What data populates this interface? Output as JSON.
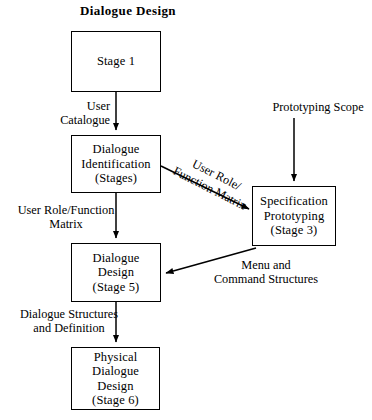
{
  "diagram": {
    "title": "Dialogue Design",
    "type": "flowchart",
    "nodes": [
      {
        "id": "stage1",
        "name": "stage-1",
        "lines": [
          "Stage 1"
        ],
        "x": 71,
        "y": 31,
        "w": 90,
        "h": 61
      },
      {
        "id": "dialogue_identification",
        "name": "dialogue-identification",
        "lines": [
          "Dialogue",
          "Identification",
          "(Stages)"
        ],
        "x": 71,
        "y": 135,
        "w": 90,
        "h": 58
      },
      {
        "id": "specification_prototyping",
        "name": "specification-prototyping",
        "lines": [
          "Specification",
          "Prototyping",
          "(Stage 3)"
        ],
        "x": 252,
        "y": 186,
        "w": 84,
        "h": 60
      },
      {
        "id": "dialogue_design",
        "name": "dialogue-design-stage-5",
        "lines": [
          "Dialogue",
          "Design",
          "(Stage 5)"
        ],
        "x": 71,
        "y": 243,
        "w": 90,
        "h": 59
      },
      {
        "id": "physical_dialogue_design",
        "name": "physical-dialogue-design",
        "lines": [
          "Physical",
          "Dialogue",
          "Design",
          "(Stage 6)"
        ],
        "x": 71,
        "y": 347,
        "w": 89,
        "h": 63
      }
    ],
    "edge_labels": [
      {
        "id": "user_catalogue",
        "name": "edge-label-user-catalogue",
        "lines": [
          "User",
          "Catalogue"
        ],
        "x": 30,
        "y": 99,
        "w": 80,
        "align": "right"
      },
      {
        "id": "user_role_function_matrix_left",
        "name": "edge-label-user-role-function-matrix",
        "lines": [
          "User Role/Function",
          "Matrix"
        ],
        "x": 3,
        "y": 203,
        "w": 126,
        "align": "center"
      },
      {
        "id": "dialogue_structures_and_definition",
        "name": "edge-label-dialogue-structures-and-definition",
        "lines": [
          "Dialogue Structures",
          "and Definition"
        ],
        "x": 3,
        "y": 307,
        "w": 132,
        "align": "center"
      },
      {
        "id": "prototyping_scope",
        "name": "edge-label-prototyping-scope",
        "lines": [
          "Prototyping Scope"
        ],
        "x": 265,
        "y": 100,
        "w": 106,
        "align": "center"
      },
      {
        "id": "menu_and_command_structures",
        "name": "edge-label-menu-and-command-structures",
        "lines": [
          "Menu and",
          "Command Structures"
        ],
        "x": 199,
        "y": 258,
        "w": 134,
        "align": "center"
      }
    ],
    "diagonal_labels": [
      {
        "id": "user_role_function_matrix_diagonal",
        "name": "edge-label-user-role-function-matrix-diagonal",
        "lines": [
          "User Role/",
          "Function Matrix"
        ],
        "cx": 213,
        "cy": 185,
        "rotate": 27
      }
    ],
    "connectors": [
      {
        "id": "stage1-to-identification",
        "name": "connector-stage1-to-dialogue-identification",
        "kind": "arrow-down"
      },
      {
        "id": "identification-to-design",
        "name": "connector-dialogue-identification-to-dialogue-design",
        "kind": "arrow-down"
      },
      {
        "id": "design-to-physical",
        "name": "connector-dialogue-design-to-physical-dialogue-design",
        "kind": "arrow-down"
      },
      {
        "id": "prototyping-scope-to-spec",
        "name": "connector-prototyping-scope-to-specification-prototyping",
        "kind": "arrow-down"
      },
      {
        "id": "identification-to-spec",
        "name": "connector-dialogue-identification-to-specification-prototyping",
        "kind": "arrow-diagonal"
      },
      {
        "id": "spec-to-design",
        "name": "connector-specification-prototyping-to-dialogue-design",
        "kind": "arrow-diagonal"
      }
    ]
  },
  "colors": {
    "background": "#ffffff",
    "stroke": "#000000",
    "text": "#000000"
  }
}
